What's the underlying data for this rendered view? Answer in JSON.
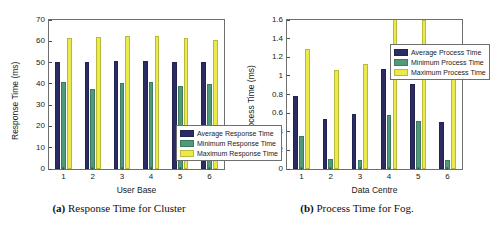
{
  "figure": {
    "panels": [
      {
        "caption_tag": "(a)",
        "caption_text": "Response Time for Cluster",
        "chart_data": {
          "type": "bar",
          "title": "",
          "xlabel": "User Base",
          "ylabel": "Response Time (ms)",
          "categories": [
            "1",
            "2",
            "3",
            "4",
            "5",
            "6"
          ],
          "xticks": [
            "1",
            "2",
            "3",
            "4",
            "5",
            "6"
          ],
          "yticks": [
            "0",
            "10",
            "20",
            "30",
            "40",
            "50",
            "60",
            "70"
          ],
          "ylim": [
            0,
            70
          ],
          "grid": false,
          "legend_position": "center-right",
          "series": [
            {
              "name": "Average Response Time",
              "color": "#2b2b66",
              "values": [
                50.3,
                50.3,
                50.7,
                50.7,
                50.4,
                50.4
              ]
            },
            {
              "name": "Minimum Response Time",
              "color": "#4f9a79",
              "values": [
                40.7,
                37.7,
                40.3,
                40.7,
                39.0,
                39.8
              ]
            },
            {
              "name": "Maximum Response Time",
              "color": "#eaea4b",
              "values": [
                61.7,
                62.2,
                62.6,
                62.6,
                61.7,
                60.8
              ]
            }
          ]
        }
      },
      {
        "caption_tag": "(b)",
        "caption_text": "Process Time for Fog.",
        "chart_data": {
          "type": "bar",
          "title": "",
          "xlabel": "Data Centre",
          "ylabel": "Process Time (ms)",
          "categories": [
            "1",
            "2",
            "3",
            "4",
            "5",
            "6"
          ],
          "xticks": [
            "1",
            "2",
            "3",
            "4",
            "5",
            "6"
          ],
          "yticks": [
            "0",
            "0.2",
            "0.4",
            "0.6",
            "0.8",
            "1",
            "1.2",
            "1.4",
            "1.6"
          ],
          "ylim": [
            0,
            1.6
          ],
          "grid": false,
          "legend_position": "top-right",
          "series": [
            {
              "name": "Average Process Time",
              "color": "#2b2b66",
              "values": [
                0.78,
                0.54,
                0.59,
                1.07,
                0.91,
                0.51
              ]
            },
            {
              "name": "Minimum Process Time",
              "color": "#4f9a79",
              "values": [
                0.35,
                0.11,
                0.1,
                0.58,
                0.52,
                0.1
              ]
            },
            {
              "name": "Maximum Process Time",
              "color": "#eaea4b",
              "values": [
                1.29,
                1.06,
                1.13,
                1.62,
                1.6,
                1.04
              ]
            }
          ]
        }
      }
    ]
  }
}
